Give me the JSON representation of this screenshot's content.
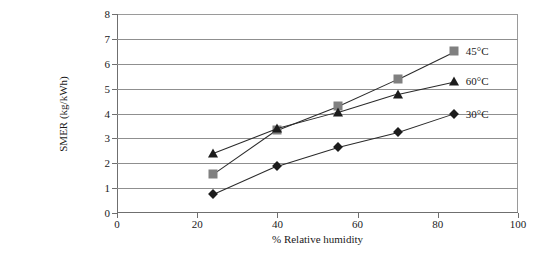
{
  "chart_data": {
    "type": "line",
    "title": "",
    "xlabel": "% Relative humidity",
    "ylabel": "SMER (kg/kWh)",
    "xlim": [
      0,
      100
    ],
    "ylim": [
      0,
      8
    ],
    "xticks": [
      0,
      20,
      40,
      60,
      80,
      100
    ],
    "yticks": [
      0,
      1,
      2,
      3,
      4,
      5,
      6,
      7,
      8
    ],
    "grid": "horizontal",
    "legend_position": "inline-right-endpoints",
    "series": [
      {
        "name": "45°C",
        "marker": "square",
        "color": "#808080",
        "x": [
          24,
          40,
          55,
          70,
          84
        ],
        "y": [
          1.55,
          3.35,
          4.3,
          5.4,
          6.5
        ]
      },
      {
        "name": "60°C",
        "marker": "triangle",
        "color": "#1c1c1c",
        "x": [
          24,
          40,
          55,
          70,
          84
        ],
        "y": [
          2.4,
          3.4,
          4.05,
          4.8,
          5.3
        ]
      },
      {
        "name": "30°C",
        "marker": "diamond",
        "color": "#1c1c1c",
        "x": [
          24,
          40,
          55,
          70,
          84
        ],
        "y": [
          0.75,
          1.9,
          2.65,
          3.25,
          4.0
        ]
      }
    ]
  }
}
